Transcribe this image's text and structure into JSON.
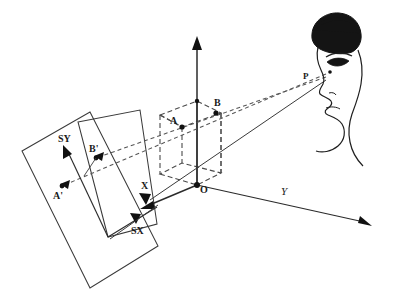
{
  "figure": {
    "background_color": "#ffffff",
    "ink_color": "#1f1f1f",
    "width": 396,
    "height": 304
  },
  "labels": {
    "axis_z": "",
    "axis_x": "X",
    "axis_y": "Y",
    "origin": "O",
    "point_a": "A",
    "point_b": "B",
    "point_a_proj": "A'",
    "point_b_proj": "B'",
    "eye_point": "P",
    "screen_x": "SX",
    "screen_y": "SY"
  },
  "geometry": {
    "origin_xy": [
      197,
      185
    ],
    "point_a_xy": [
      182,
      127
    ],
    "point_b_xy": [
      216,
      113
    ],
    "point_a_proj_xy": [
      62,
      186
    ],
    "point_b_proj_xy": [
      96,
      158
    ],
    "eye_xy": [
      330,
      72
    ],
    "axis_z_tip_xy": [
      197,
      36
    ],
    "axis_y_tip_xy": [
      372,
      226
    ],
    "axis_x_tip_xy": [
      143,
      209
    ],
    "screen_origin_xy": [
      141,
      236
    ],
    "screen_sx_tip_xy": [
      136,
      224
    ],
    "screen_sy_tip_xy": [
      63,
      146
    ]
  },
  "elements": {
    "screen_plane_outer": "outer screen plane quadrilateral",
    "screen_plane_inner": "inner projection window quadrilateral",
    "box": "dashed rectangular box in world space",
    "head": "human head profile with eye at viewpoint P",
    "sight_line_a": "dashed line of sight from P through A to A'",
    "sight_line_b": "dashed line of sight from P through B to B'"
  }
}
